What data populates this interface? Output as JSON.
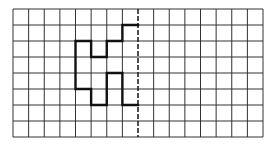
{
  "diagram": {
    "type": "symmetry-grid",
    "grid": {
      "columns": 16,
      "rows": 8,
      "origin_x": 13,
      "origin_y": 9,
      "cell_width": 15.625,
      "cell_height": 16,
      "line_color": "#333333",
      "line_width": 1
    },
    "axis_of_symmetry": {
      "orientation": "vertical",
      "column_index": 8,
      "style": "dashed",
      "color": "#222222"
    },
    "shape": {
      "description": "Bold half-figure drawn on the left of the dashed line of symmetry",
      "stroke_color": "#111111",
      "stroke_width": 2.4,
      "path_grid_points": [
        [
          8,
          1
        ],
        [
          7,
          1
        ],
        [
          7,
          2
        ],
        [
          6,
          2
        ],
        [
          6,
          3
        ],
        [
          5,
          3
        ],
        [
          5,
          2
        ],
        [
          4,
          2
        ],
        [
          4,
          5
        ],
        [
          5,
          5
        ],
        [
          5,
          6
        ],
        [
          6,
          6
        ],
        [
          6,
          4
        ],
        [
          7,
          4
        ],
        [
          7,
          6
        ],
        [
          8,
          6
        ]
      ]
    }
  }
}
